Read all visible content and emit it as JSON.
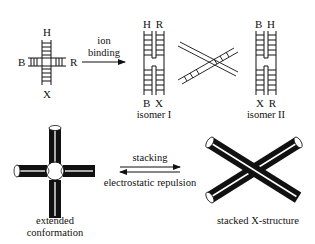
{
  "junction": {
    "arm_labels": {
      "top": "H",
      "left": "B",
      "right": "R",
      "bottom": "X"
    }
  },
  "ion_binding_arrow": {
    "label_line1": "ion",
    "label_line2": "binding"
  },
  "isomer_1": {
    "top_labels": "H R",
    "bottom_labels": "B X",
    "caption": "isomer I"
  },
  "isomer_2": {
    "top_labels": "B H",
    "bottom_labels": "X R",
    "caption": "isomer II"
  },
  "equilibrium": {
    "forward_label": "stacking",
    "reverse_label": "electrostatic repulsion"
  },
  "extended": {
    "caption_line1": "extended",
    "caption_line2": "conformation"
  },
  "stacked": {
    "caption": "stacked X-structure"
  },
  "colors": {
    "ink": "#111111",
    "background": "#ffffff"
  }
}
